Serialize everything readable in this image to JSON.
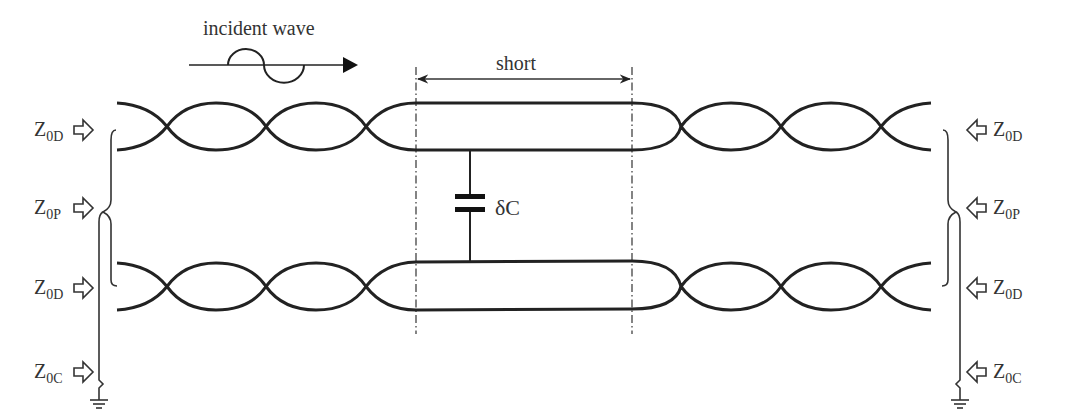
{
  "diagram": {
    "incident_wave_label": "incident wave",
    "short_label": "short",
    "capacitor_label": "δC",
    "left_labels": [
      {
        "main": "Z",
        "sub": "0D"
      },
      {
        "main": "Z",
        "sub": "0P"
      },
      {
        "main": "Z",
        "sub": "0D"
      },
      {
        "main": "Z",
        "sub": "0C"
      }
    ],
    "right_labels": [
      {
        "main": "Z",
        "sub": "0D"
      },
      {
        "main": "Z",
        "sub": "0P"
      },
      {
        "main": "Z",
        "sub": "0D"
      },
      {
        "main": "Z",
        "sub": "0C"
      }
    ]
  }
}
